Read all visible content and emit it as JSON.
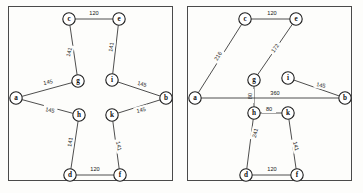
{
  "figure": {
    "panel_count": 2,
    "node_radius": 6.2,
    "colors": {
      "background": "#fdfdfb",
      "frame_stroke": "#4a4a4a",
      "edge_stroke": "#3a3a3a",
      "node_fill": "#ffffff",
      "node_stroke": "#1e1e1e",
      "text": "#111111"
    }
  },
  "chart_data": [
    {
      "type": "diagram",
      "panel": "left",
      "title": "",
      "description": "Weighted undirected graph with 10 labelled nodes",
      "nodes": [
        {
          "id": "a",
          "label": "a",
          "x": 16,
          "y": 98
        },
        {
          "id": "b",
          "label": "b",
          "x": 166,
          "y": 98
        },
        {
          "id": "c",
          "label": "c",
          "x": 69,
          "y": 19
        },
        {
          "id": "d",
          "label": "d",
          "x": 70,
          "y": 175
        },
        {
          "id": "e",
          "label": "e",
          "x": 119,
          "y": 19
        },
        {
          "id": "f",
          "label": "f",
          "x": 120,
          "y": 175
        },
        {
          "id": "g",
          "label": "g",
          "x": 78,
          "y": 81
        },
        {
          "id": "h",
          "label": "h",
          "x": 79,
          "y": 115
        },
        {
          "id": "i",
          "label": "i",
          "x": 112,
          "y": 80
        },
        {
          "id": "k",
          "label": "k",
          "x": 112,
          "y": 115
        }
      ],
      "edges": [
        {
          "from": "c",
          "to": "e",
          "weight": 120,
          "label_x": 94,
          "label_y": 13,
          "rotation": 0
        },
        {
          "from": "c",
          "to": "g",
          "weight": 141,
          "label_x": 69,
          "label_y": 52,
          "rotation": -75
        },
        {
          "from": "a",
          "to": "g",
          "weight": 145,
          "label_x": 48,
          "label_y": 82,
          "rotation": -12
        },
        {
          "from": "a",
          "to": "h",
          "weight": 145,
          "label_x": 50,
          "label_y": 110,
          "rotation": 13
        },
        {
          "from": "e",
          "to": "i",
          "weight": 141,
          "label_x": 111,
          "label_y": 47,
          "rotation": -80
        },
        {
          "from": "i",
          "to": "b",
          "weight": 145,
          "label_x": 142,
          "label_y": 84,
          "rotation": 14
        },
        {
          "from": "k",
          "to": "b",
          "weight": 145,
          "label_x": 141,
          "label_y": 110,
          "rotation": -13
        },
        {
          "from": "h",
          "to": "d",
          "weight": 141,
          "label_x": 70,
          "label_y": 142,
          "rotation": -82
        },
        {
          "from": "k",
          "to": "f",
          "weight": 141,
          "label_x": 119,
          "label_y": 146,
          "rotation": 78
        },
        {
          "from": "d",
          "to": "f",
          "weight": 120,
          "label_x": 95,
          "label_y": 169,
          "rotation": 0
        }
      ]
    },
    {
      "type": "diagram",
      "panel": "right",
      "title": "",
      "description": "Weighted undirected graph with 10 labelled nodes, alternate edge set",
      "nodes": [
        {
          "id": "a",
          "label": "a",
          "x": 13,
          "y": 98
        },
        {
          "id": "b",
          "label": "b",
          "x": 163,
          "y": 98
        },
        {
          "id": "c",
          "label": "c",
          "x": 63,
          "y": 19
        },
        {
          "id": "d",
          "label": "d",
          "x": 64,
          "y": 175
        },
        {
          "id": "e",
          "label": "e",
          "x": 114,
          "y": 19
        },
        {
          "id": "f",
          "label": "f",
          "x": 115,
          "y": 175
        },
        {
          "id": "g",
          "label": "g",
          "x": 72,
          "y": 80
        },
        {
          "id": "h",
          "label": "h",
          "x": 72,
          "y": 113
        },
        {
          "id": "i",
          "label": "i",
          "x": 106,
          "y": 78
        },
        {
          "id": "k",
          "label": "k",
          "x": 106,
          "y": 113
        }
      ],
      "edges": [
        {
          "from": "c",
          "to": "e",
          "weight": 120,
          "label_x": 90,
          "label_y": 13,
          "rotation": 0
        },
        {
          "from": "a",
          "to": "c",
          "weight": 216,
          "label_x": 36,
          "label_y": 56,
          "rotation": -58
        },
        {
          "from": "e",
          "to": "g",
          "weight": 172,
          "label_x": 93,
          "label_y": 48,
          "rotation": -55
        },
        {
          "from": "g",
          "to": "h",
          "weight": 80,
          "label_x": 68,
          "label_y": 96,
          "rotation": -90
        },
        {
          "from": "a",
          "to": "b",
          "weight": 360,
          "label_x": 93,
          "label_y": 93,
          "rotation": 0
        },
        {
          "from": "h",
          "to": "k",
          "weight": 80,
          "label_x": 87,
          "label_y": 109,
          "rotation": 0
        },
        {
          "from": "i",
          "to": "b",
          "weight": 145,
          "label_x": 139,
          "label_y": 85,
          "rotation": 12
        },
        {
          "from": "h",
          "to": "d",
          "weight": 241,
          "label_x": 73,
          "label_y": 133,
          "rotation": -74
        },
        {
          "from": "k",
          "to": "f",
          "weight": 141,
          "label_x": 114,
          "label_y": 146,
          "rotation": 77
        },
        {
          "from": "d",
          "to": "f",
          "weight": 120,
          "label_x": 90,
          "label_y": 169,
          "rotation": 0
        }
      ]
    }
  ]
}
